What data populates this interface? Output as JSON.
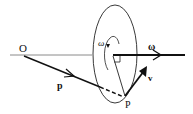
{
  "diagram": {
    "labels": {
      "origin": "O",
      "position_vector": "p",
      "point": "P",
      "velocity": "v",
      "angular_velocity_axis": "ω",
      "rotation_sense": "ω"
    },
    "colors": {
      "stroke": "#111111",
      "axis_light": "#8a8a8a",
      "background": "#ffffff"
    }
  }
}
